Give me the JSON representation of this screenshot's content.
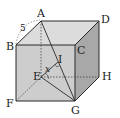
{
  "diagram": {
    "type": "cube",
    "vertices": {
      "A": "A",
      "B": "B",
      "C": "C",
      "D": "D",
      "E": "E",
      "F": "F",
      "G": "G",
      "H": "H"
    },
    "extra_points": {
      "I": "I"
    },
    "edge_length_label": "5",
    "angle_label": "x",
    "colors": {
      "top_face": "#d9d9d9",
      "front_face": "#cfcfcf",
      "side_face": "#a9a9a9",
      "line": "#2a2a2a"
    }
  }
}
